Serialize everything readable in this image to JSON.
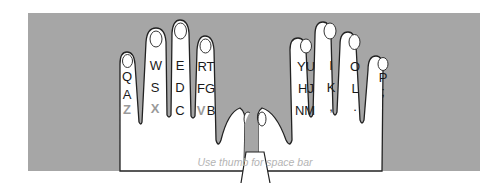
{
  "diagram": {
    "colors": {
      "background": "#ffffff",
      "panel": "#a6a6a6",
      "hand": "#ffffff",
      "outline": "#222222",
      "key_text": "#1a1a1a",
      "key_text_dim": "#9a9a9a",
      "caption": "#b4b4b4"
    },
    "caption": "Use thumb for space bar",
    "left_hand": {
      "pinky": {
        "row1": "Q",
        "row2": "A",
        "row3": "Z",
        "row3_dim": true
      },
      "ring": {
        "row1": "W",
        "row2": "S",
        "row3": "X",
        "row3_dim": true
      },
      "middle": {
        "row1": "E",
        "row2": "D",
        "row3": "C",
        "row3_dim": false
      },
      "index": {
        "row1": "RT",
        "row2": "FG",
        "row3_a": "V",
        "row3_b": "B",
        "row3_a_dim": true
      }
    },
    "right_hand": {
      "index": {
        "row1": "YU",
        "row2": "HJ",
        "row3": "NM"
      },
      "middle": {
        "row1": "I",
        "row2": "K",
        "row3": ","
      },
      "ring": {
        "row1": "O",
        "row2": "L",
        "row3": "."
      },
      "pinky": {
        "row1": "P",
        "row2": ";"
      }
    }
  }
}
